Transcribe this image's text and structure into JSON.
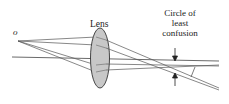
{
  "diagram": {
    "labels": {
      "object_point": "o",
      "lens": "Lens",
      "circle_line1": "Circle of",
      "circle_line2": "least",
      "circle_line3": "confusion"
    },
    "colors": {
      "lens_fill": "#c8c8c8",
      "lens_stroke": "#333333",
      "ray_stroke": "#444444",
      "text": "#222222"
    }
  }
}
